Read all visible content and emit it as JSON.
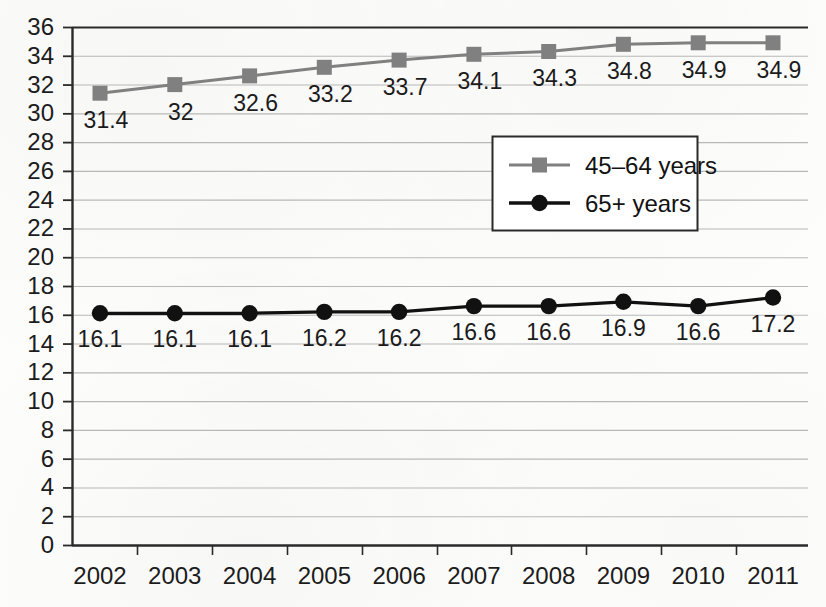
{
  "chart_data": {
    "type": "line",
    "title": "",
    "subtitle": "",
    "xlabel": "",
    "ylabel": "",
    "categories": [
      "2002",
      "2003",
      "2004",
      "2005",
      "2006",
      "2007",
      "2008",
      "2009",
      "2010",
      "2011"
    ],
    "ylim": [
      0,
      36
    ],
    "ytick_step": 2,
    "yticks": [
      "36",
      "34",
      "32",
      "30",
      "28",
      "26",
      "24",
      "22",
      "20",
      "18",
      "16",
      "14",
      "12",
      "10",
      "8",
      "6",
      "4",
      "2",
      "0"
    ],
    "grid": true,
    "grid_axis": "y",
    "legend_position": "upper-center-right",
    "series": [
      {
        "name": "45–64 years",
        "marker": "square",
        "color": "#808080",
        "values": [
          31.4,
          32,
          32.6,
          33.2,
          33.7,
          34.1,
          34.3,
          34.8,
          34.9,
          34.9
        ],
        "labels": [
          "31.4",
          "32",
          "32.6",
          "33.2",
          "33.7",
          "34.1",
          "34.3",
          "34.8",
          "34.9",
          "34.9"
        ]
      },
      {
        "name": "65+ years",
        "marker": "circle",
        "color": "#111111",
        "values": [
          16.1,
          16.1,
          16.1,
          16.2,
          16.2,
          16.6,
          16.6,
          16.9,
          16.6,
          17.2
        ],
        "labels": [
          "16.1",
          "16.1",
          "16.1",
          "16.2",
          "16.2",
          "16.6",
          "16.6",
          "16.9",
          "16.6",
          "17.2"
        ]
      }
    ]
  },
  "legend": {
    "entries": [
      {
        "label": "45–64 years"
      },
      {
        "label": "65+ years"
      }
    ]
  },
  "colors": {
    "series_gray": "#808080",
    "series_black": "#111111",
    "gridline": "#b8b8b8",
    "axis": "#2a2a2a",
    "background": "#fdfdfc",
    "text": "#1c1c1c"
  }
}
